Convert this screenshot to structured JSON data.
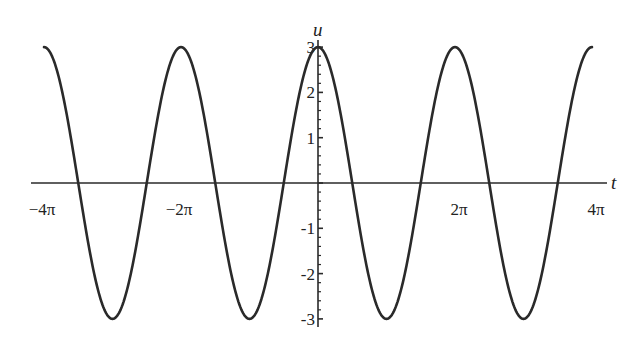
{
  "chart_data": {
    "type": "line",
    "title": "",
    "xlabel": "t",
    "ylabel": "u",
    "function": "u = 3 cos(t)",
    "xlim": [
      -13.3,
      13.0
    ],
    "ylim": [
      -3.1,
      3.2
    ],
    "x_domain": [
      -12.566,
      12.566
    ],
    "x_ticks": [
      {
        "value": -12.566,
        "label": "−4π"
      },
      {
        "value": -6.283,
        "label": "−2π"
      },
      {
        "value": 6.283,
        "label": "2π"
      },
      {
        "value": 12.566,
        "label": "4π"
      }
    ],
    "y_ticks": [
      {
        "value": 3,
        "label": "3"
      },
      {
        "value": 2,
        "label": "2"
      },
      {
        "value": 1,
        "label": "1"
      },
      {
        "value": -1,
        "label": "-1"
      },
      {
        "value": -2,
        "label": "-2"
      },
      {
        "value": -3,
        "label": "-3"
      }
    ],
    "y_minor_step": 0.2,
    "series": [
      {
        "name": "u(t)",
        "amplitude": 3,
        "angular_frequency": 1,
        "phase": 0,
        "peaks_t": [
          -12.566,
          -6.283,
          0,
          6.283,
          12.566
        ],
        "troughs_t": [
          -9.425,
          -3.142,
          3.142,
          9.425
        ],
        "color": "#2a2a2a"
      }
    ],
    "grid": false,
    "legend": "none"
  }
}
